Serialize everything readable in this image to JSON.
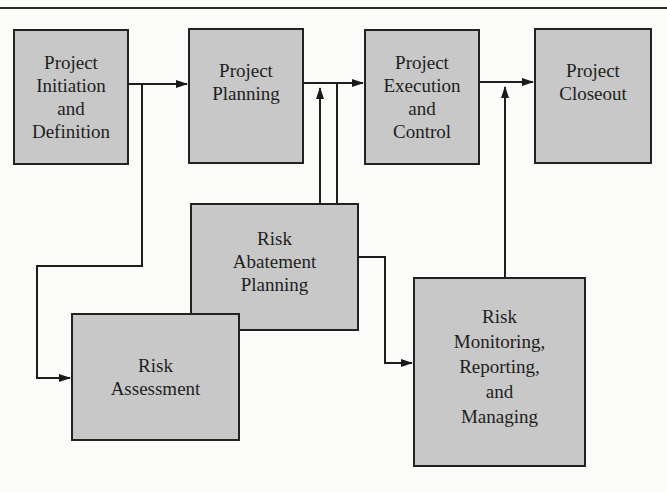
{
  "diagram": {
    "type": "flowchart",
    "nodes": [
      {
        "id": "initiation",
        "label": "Project\nInitiation\nand\nDefinition"
      },
      {
        "id": "planning",
        "label": "Project\nPlanning"
      },
      {
        "id": "execution",
        "label": "Project\nExecution\nand\nControl"
      },
      {
        "id": "closeout",
        "label": "Project\nCloseout"
      },
      {
        "id": "abatement",
        "label": "Risk\nAbatement\nPlanning"
      },
      {
        "id": "assessment",
        "label": "Risk\nAssessment"
      },
      {
        "id": "monitoring",
        "label": "Risk\nMonitoring,\nReporting,\nand\nManaging"
      }
    ],
    "edges": [
      {
        "from": "initiation",
        "to": "planning"
      },
      {
        "from": "initiation",
        "to": "assessment"
      },
      {
        "from": "planning",
        "to": "execution"
      },
      {
        "from": "abatement",
        "to": "execution"
      },
      {
        "from": "planning",
        "to": "monitoring"
      },
      {
        "from": "execution",
        "to": "closeout"
      },
      {
        "from": "monitoring",
        "to": "closeout"
      }
    ],
    "colors": {
      "box_fill": "#c8c8c8",
      "stroke": "#222222",
      "background": "#fbfbfa"
    }
  }
}
